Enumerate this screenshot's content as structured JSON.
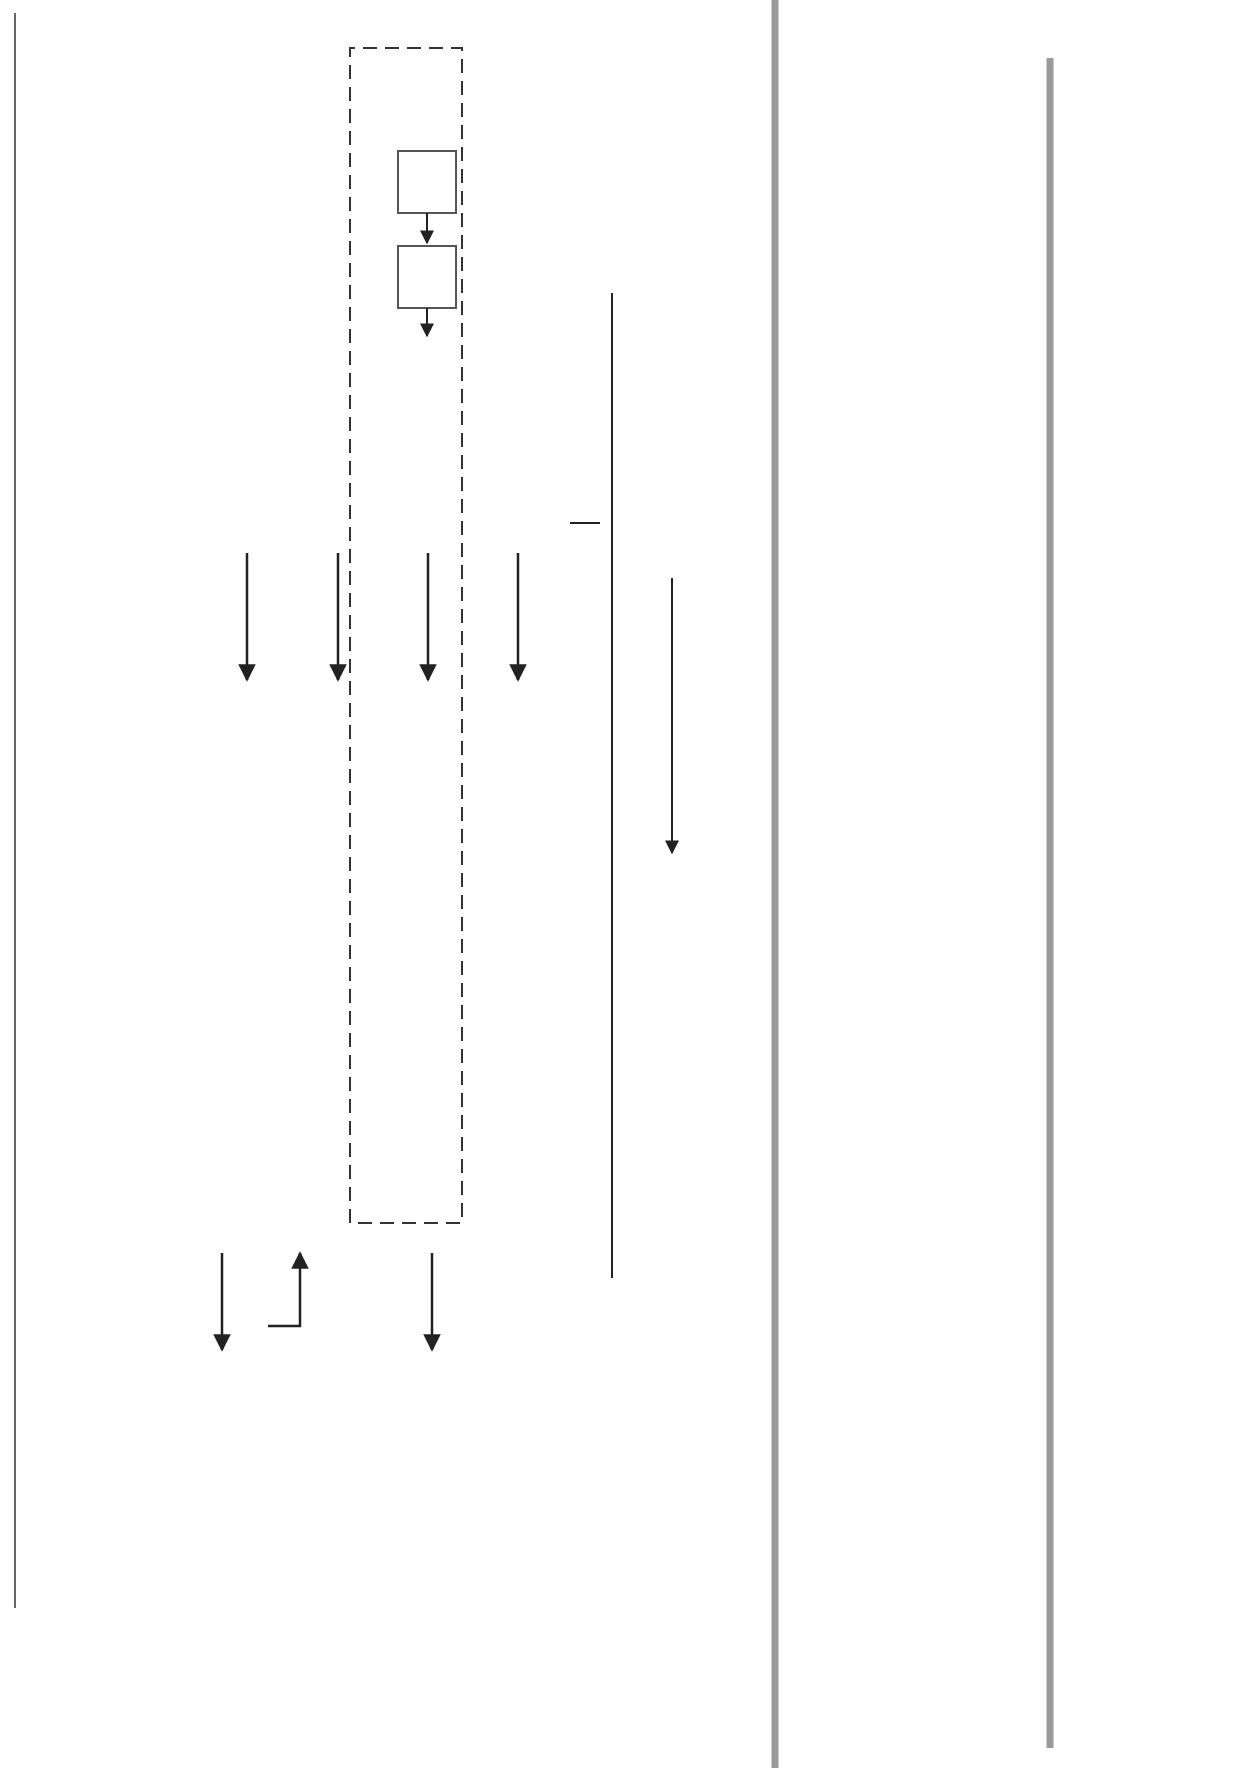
{
  "levels": {
    "level1": {
      "title": "Level 1",
      "subtitle": "Enterprise/\nBusiness",
      "line1": "Enterprise/",
      "line2": "Business"
    },
    "level2": {
      "title": "Level 2",
      "line1": "Value Creation",
      "line2": "System"
    }
  },
  "business_environment": {
    "title": "Business Environment",
    "factors": [
      "Geopolitical",
      "Regulatory/Legal",
      "Economy",
      "Natural Environment",
      "Culture"
    ]
  },
  "resources": {
    "title": "Resources",
    "items": [
      {
        "line1": "Capital",
        "line2": "Market"
      },
      {
        "line1": "Labor",
        "line2": "Market"
      },
      {
        "line1": "Suppliers",
        "line2": ""
      },
      {
        "line1": "Technology",
        "line2": "Providers"
      }
    ]
  },
  "flows": {
    "capital": "Capital",
    "human_1": "Human",
    "human_2": "Resources",
    "materials_1": "Materials/",
    "materials_2": "Equipment",
    "technology": "Technology",
    "returns": "Returns",
    "investments": "Investments",
    "products_1": "Products/",
    "products_2": "Services",
    "order": "Order for Product/Service",
    "product": "Product",
    "resources": "Resources",
    "product_service_out": "Product/Service"
  },
  "value_chain": {
    "label": "Value Chain"
  },
  "enterprise": {
    "title": "Any Enterprise",
    "management_system": "Management System",
    "businesses": {
      "title": "Businesses",
      "management_system": "Management System",
      "value_creation_system": "Value Creation System"
    }
  },
  "financial_stakeholders": {
    "line1": "Financial",
    "line2": "Stakeholders"
  },
  "markets": {
    "title": "Markets",
    "customers": "Customers"
  },
  "competition": {
    "title": "Competition"
  },
  "process": {
    "steps": [
      {
        "line1": "Product/Service",
        "line2": "Launched"
      },
      {
        "line1": "Product/Service",
        "line2": "Sold"
      },
      {
        "line1": "Product/Service",
        "line2": "Delivered"
      }
    ]
  },
  "badges": [
    "1",
    "2",
    "3",
    "4",
    "1"
  ],
  "callouts": {
    "goal1": {
      "bullets": [
        "Business XXX has an annual revenue goal of $300,000,000 and a profit margin of . . .",
        "This is also the goal of XXX's Value Creation System.",
        "This Value Creation System goal (1) links to goals for each of the Processing Sub-Systems in the Value Creation System."
      ]
    },
    "delivered": {
      "title": "Goals for Delivered:",
      "subtitle": "Produce and install",
      "bullets": [
        "X units of product A at a unit cost of Y",
        "2X units of product D at a unit cost of Z",
        "3X units of product E at a unit cost of W"
      ]
    },
    "sold": {
      "title": "Goals for Sold:",
      "bullets": [
        "Sales of $330,000,000 in next 12 months, distributed by product and new versus existing customers, as follows . . ."
      ]
    },
    "launched": {
      "title": "Goals for Launched:",
      "bullets": [
        "Enhance and reintroduce product A in four months",
        "Launch product B in six months",
        "Move new products C and D to Phase 3 in the development process in 10 months, in preparation for launch in 18 months"
      ]
    }
  },
  "colors": {
    "panel_gray": "#b9b9b9",
    "callout_gray": "#bdbdbd",
    "badge": "#2a2a2a",
    "rule": "#999999"
  }
}
